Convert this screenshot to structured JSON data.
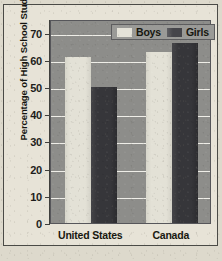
{
  "chart_data": {
    "type": "bar",
    "title": "",
    "xlabel": "",
    "ylabel": "Percentage of High School Students",
    "ylim": [
      0,
      75
    ],
    "yticks": [
      0,
      10,
      20,
      30,
      40,
      50,
      60,
      70
    ],
    "ytick_labels": [
      "0",
      "10",
      "20",
      "30",
      "40",
      "50",
      "60",
      "70"
    ],
    "grid": true,
    "legend_position": "top-right",
    "categories": [
      "United States",
      "Canada"
    ],
    "series": [
      {
        "name": "Boys",
        "values": [
          61,
          63
        ],
        "color": "#e3e1d6"
      },
      {
        "name": "Girls",
        "values": [
          50,
          66
        ],
        "color": "#36363a"
      }
    ]
  },
  "legend": {
    "items": [
      {
        "label": "Boys"
      },
      {
        "label": "Girls"
      }
    ]
  },
  "colors": {
    "page_background": "#ddd9cc",
    "plot_background": "#8d8d8a",
    "gridline": "#efeee8",
    "axis": "#3f3f3c",
    "text": "#17170f",
    "boys_bar": "#e3e1d6",
    "girls_bar": "#36363a"
  }
}
